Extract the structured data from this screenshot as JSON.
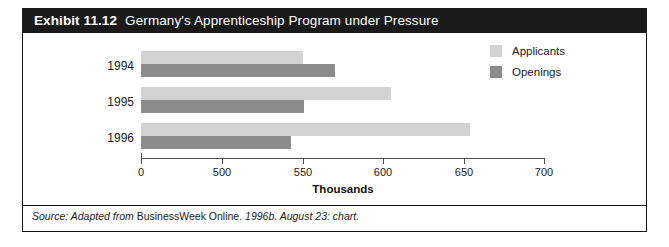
{
  "exhibit": {
    "label": "Exhibit 11.12",
    "title": "Germany's Apprenticeship Program under Pressure"
  },
  "legend": {
    "items": [
      {
        "label": "Applicants",
        "color": "#d2d2d2"
      },
      {
        "label": "Openings",
        "color": "#8c8c8c"
      }
    ]
  },
  "source": {
    "prefix": "Source: Adapted from",
    "body": "BusinessWeek Online.",
    "suffix": "1996b. August 23: chart."
  },
  "chart_data": {
    "type": "bar",
    "orientation": "horizontal",
    "title": "Germany's Apprenticeship Program under Pressure",
    "xlabel": "Thousands",
    "ylabel": "",
    "categories": [
      "1994",
      "1995",
      "1996"
    ],
    "series": [
      {
        "name": "Applicants",
        "color": "#d2d2d2",
        "values": [
          550,
          605,
          654
        ]
      },
      {
        "name": "Openings",
        "color": "#8c8c8c",
        "values": [
          570,
          551,
          543
        ]
      }
    ],
    "xlim": [
      0,
      700
    ],
    "axis_break": true,
    "tick_values": [
      0,
      500,
      550,
      600,
      650,
      700
    ],
    "tick_labels": [
      "0",
      "500",
      "550",
      "600",
      "650",
      "700"
    ],
    "grid": false,
    "legend_position": "top-right"
  }
}
